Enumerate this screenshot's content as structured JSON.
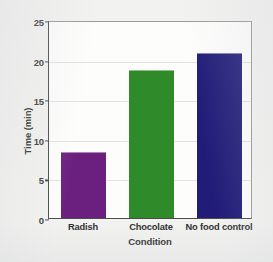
{
  "chart_data": {
    "type": "bar",
    "title": "",
    "xlabel": "Condition",
    "ylabel": "Time (min)",
    "categories": [
      "Radish",
      "Chocolate",
      "No food control"
    ],
    "values": [
      8.3,
      18.7,
      20.8
    ],
    "ylim": [
      0,
      25
    ],
    "yticks": [
      0,
      5,
      10,
      15,
      20,
      25
    ],
    "ytick_labels": [
      "0",
      "5",
      "10",
      "15",
      "20",
      "25"
    ],
    "bar_colors": [
      "#6B2080",
      "#2F8A2A",
      "#201C78"
    ],
    "grid": "horizontal",
    "legend": "none"
  },
  "style": {
    "background": "#f2f2f0",
    "plot_background": "#fdfdfc",
    "gridline_color": "#e2e2e2",
    "axis_color": "#4c4c4c",
    "text_color": "#2e2e2e"
  }
}
